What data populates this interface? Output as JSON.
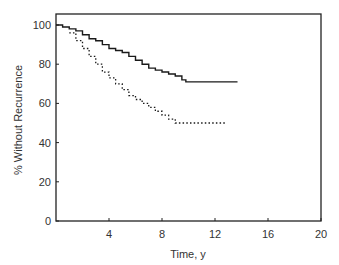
{
  "chart_data": {
    "type": "line",
    "title": "",
    "xlabel": "Time, y",
    "ylabel": "% Without Recurrence",
    "xlim": [
      0,
      20
    ],
    "ylim": [
      0,
      100
    ],
    "xticks": [
      4,
      8,
      12,
      16,
      20
    ],
    "yticks": [
      0,
      20,
      40,
      60,
      80,
      100
    ],
    "grid": false,
    "legend": null,
    "series": [
      {
        "name": "Solid curve",
        "style": "solid",
        "step": true,
        "x": [
          0,
          0.5,
          1.0,
          1.5,
          2.0,
          2.5,
          3.0,
          3.5,
          4.0,
          4.5,
          5.0,
          5.5,
          6.0,
          6.5,
          7.0,
          7.5,
          8.0,
          8.5,
          9.0,
          9.5,
          9.8,
          13.7
        ],
        "y": [
          100,
          99,
          98,
          97,
          95,
          93,
          92,
          90,
          88,
          87,
          86,
          84,
          82,
          80,
          78,
          77,
          76,
          75,
          74,
          72,
          71,
          71
        ]
      },
      {
        "name": "Dotted curve",
        "style": "dotted",
        "step": true,
        "x": [
          1.0,
          1.5,
          2.0,
          2.5,
          3.0,
          3.5,
          4.0,
          4.5,
          5.0,
          5.5,
          6.0,
          6.5,
          7.0,
          7.5,
          8.0,
          8.5,
          9.0,
          12.8
        ],
        "y": [
          96,
          92,
          88,
          84,
          80,
          76,
          73,
          70,
          67,
          64,
          62,
          60,
          58,
          56,
          54,
          52,
          50,
          50
        ]
      }
    ]
  },
  "axes": {
    "x_title": "Time, y",
    "y_title": "% Without Recurrence",
    "x_tick_labels": [
      "4",
      "8",
      "12",
      "16",
      "20"
    ],
    "y_tick_labels": [
      "0",
      "20",
      "40",
      "60",
      "80",
      "100"
    ]
  }
}
